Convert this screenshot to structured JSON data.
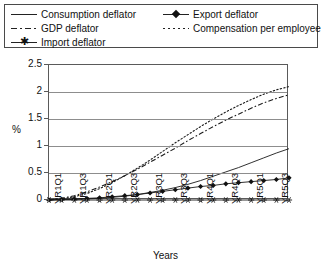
{
  "legend": {
    "entries": [
      {
        "label": "Consumption deflator",
        "marker": "solid-line"
      },
      {
        "label": "GDP deflator",
        "marker": "dash-dot-line"
      },
      {
        "label": "Import deflator",
        "marker": "asterisk-line"
      },
      {
        "label": "Export deflator",
        "marker": "diamond-line"
      },
      {
        "label": "Compensation per employee",
        "marker": "dotted-line"
      }
    ]
  },
  "chart_data": {
    "type": "line",
    "title": "",
    "xlabel": "Years",
    "ylabel": "%",
    "ylim": [
      0,
      2.5
    ],
    "yticks": [
      "0",
      "0.5",
      "1",
      "1.5",
      "2",
      "2.5"
    ],
    "ytick_values": [
      0,
      0.5,
      1,
      1.5,
      2,
      2.5
    ],
    "grid": true,
    "legend_position": "top",
    "x": [
      "YR1Q1",
      "YR1Q2",
      "YR1Q3",
      "YR1Q4",
      "YR2Q1",
      "YR2Q2",
      "YR2Q3",
      "YR2Q4",
      "YR3Q1",
      "YR3Q2",
      "YR3Q3",
      "YR3Q4",
      "YR4Q1",
      "YR4Q2",
      "YR4Q3",
      "YR4Q4",
      "YR5Q1",
      "YR5Q2",
      "YR5Q3",
      "YR5Q4"
    ],
    "xtick_labels": [
      "YR1Q1",
      "YR1Q3",
      "YR2Q1",
      "YR2Q3",
      "YR3Q1",
      "YR3Q3",
      "YR4Q1",
      "YR4Q3",
      "YR5Q1",
      "YR5Q3"
    ],
    "series": [
      {
        "name": "Consumption deflator",
        "style": "solid",
        "marker": "none",
        "values": [
          0.0,
          0.01,
          0.01,
          0.02,
          0.03,
          0.05,
          0.07,
          0.1,
          0.14,
          0.18,
          0.23,
          0.29,
          0.36,
          0.44,
          0.52,
          0.6,
          0.69,
          0.78,
          0.87,
          0.95
        ]
      },
      {
        "name": "GDP deflator",
        "style": "dash-dot",
        "marker": "none",
        "values": [
          0.0,
          0.03,
          0.08,
          0.15,
          0.24,
          0.34,
          0.45,
          0.57,
          0.7,
          0.83,
          0.96,
          1.1,
          1.23,
          1.36,
          1.48,
          1.59,
          1.7,
          1.8,
          1.88,
          1.95
        ]
      },
      {
        "name": "Import deflator",
        "style": "solid",
        "marker": "asterisk",
        "values": [
          0.0,
          0.0,
          0.0,
          0.0,
          0.0,
          0.0,
          0.0,
          0.0,
          0.0,
          0.0,
          0.0,
          0.0,
          0.0,
          0.0,
          0.0,
          0.0,
          0.0,
          0.0,
          0.0,
          0.0
        ]
      },
      {
        "name": "Export deflator",
        "style": "solid",
        "marker": "diamond",
        "values": [
          0.0,
          0.01,
          0.02,
          0.03,
          0.04,
          0.06,
          0.08,
          0.1,
          0.13,
          0.16,
          0.19,
          0.22,
          0.25,
          0.27,
          0.3,
          0.32,
          0.34,
          0.36,
          0.38,
          0.41
        ]
      },
      {
        "name": "Compensation per employee",
        "style": "dotted",
        "marker": "none",
        "values": [
          0.0,
          0.02,
          0.06,
          0.12,
          0.21,
          0.32,
          0.45,
          0.59,
          0.74,
          0.9,
          1.06,
          1.21,
          1.36,
          1.5,
          1.63,
          1.75,
          1.86,
          1.96,
          2.04,
          2.1
        ]
      }
    ]
  }
}
